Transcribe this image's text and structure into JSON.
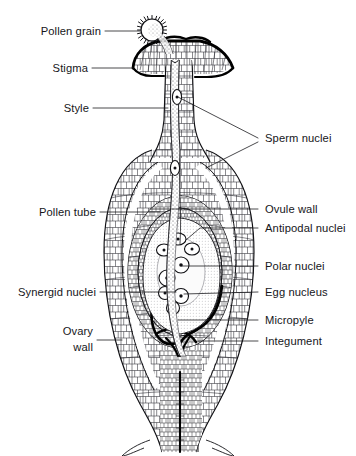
{
  "figure": {
    "width": 356,
    "height": 456,
    "background_color": "#ffffff",
    "ink_color": "#111115",
    "style": "black-and-white line drawing, stippled and cell-textured botanical illustration"
  },
  "labels_left": [
    {
      "id": "pollen-grain",
      "text": "Pollen grain",
      "x": 103,
      "y": 34,
      "leader_to_x": 140,
      "leader_to_y": 31
    },
    {
      "id": "stigma",
      "text": "Stigma",
      "x": 103,
      "y": 71,
      "leader_to_x": 133,
      "leader_to_y": 68
    },
    {
      "id": "style",
      "text": "Style",
      "x": 103,
      "y": 111,
      "leader_to_x": 168,
      "leader_to_y": 108
    },
    {
      "id": "pollen-tube",
      "text": "Pollen tube",
      "x": 103,
      "y": 215,
      "leader_to_x": 160,
      "leader_to_y": 212
    },
    {
      "id": "synergid-nuclei",
      "text": "Synergid nuclei",
      "x": 103,
      "y": 295,
      "leader_to_x": 176,
      "leader_to_y": 292
    },
    {
      "id": "ovary-wall-1",
      "text": "Ovary",
      "x": 103,
      "y": 334,
      "leader_to_x": 120,
      "leader_to_y": 340
    },
    {
      "id": "ovary-wall-2",
      "text": "wall",
      "x": 103,
      "y": 350,
      "leader_to_x": null,
      "leader_to_y": null
    }
  ],
  "labels_right": [
    {
      "id": "sperm-nuclei",
      "text": "Sperm nuclei",
      "x": 265,
      "y": 142,
      "leader_to_x": 178,
      "leader_to_y": 97
    },
    {
      "id": "ovule-wall",
      "text": "Ovule wall",
      "x": 265,
      "y": 212,
      "leader_to_x": 150,
      "leader_to_y": 212
    },
    {
      "id": "antipodal-nuclei",
      "text": "Antipodal nuclei",
      "x": 265,
      "y": 231,
      "leader_to_x": 186,
      "leader_to_y": 239
    },
    {
      "id": "polar-nuclei",
      "text": "Polar nuclei",
      "x": 265,
      "y": 269,
      "leader_to_x": 178,
      "leader_to_y": 267
    },
    {
      "id": "egg-nucleus",
      "text": "Egg nucleus",
      "x": 265,
      "y": 295,
      "leader_to_x": 180,
      "leader_to_y": 293
    },
    {
      "id": "micropyle",
      "text": "Micropyle",
      "x": 265,
      "y": 323,
      "leader_to_x": 176,
      "leader_to_y": 321
    },
    {
      "id": "integument",
      "text": "Integument",
      "x": 265,
      "y": 344,
      "leader_to_x": 196,
      "leader_to_y": 343
    }
  ],
  "sperm_nuclei_second_leader": {
    "from_x": 262,
    "from_y": 142,
    "to_x": 206,
    "to_y": 168
  },
  "structures": {
    "pollen_grain": {
      "name": "pollen grain",
      "cx": 152,
      "cy": 30,
      "r": 11,
      "spikes": 34
    },
    "stigma": {
      "name": "stigma",
      "description": "flared, dark-rimmed receptive surface at top of style"
    },
    "style": {
      "name": "style",
      "description": "elongated column connecting stigma to ovary"
    },
    "pollen_tube": {
      "name": "pollen tube",
      "description": "stippled tube running down through the style into the ovule"
    },
    "ovary_wall": {
      "name": "ovary wall",
      "description": "outer cellular oval enclosing the ovule"
    },
    "ovule_wall": {
      "name": "ovule wall",
      "description": "inner oval layer of the ovule"
    },
    "integument": {
      "name": "integument",
      "description": "heavy dark layer surrounding embryo sac, open at the micropyle"
    },
    "micropyle": {
      "name": "micropyle",
      "description": "opening in the integument where the pollen tube enters"
    },
    "embryo_sac": {
      "name": "embryo sac",
      "description": "pale central sac containing the nuclei"
    },
    "antipodal_nuclei": {
      "name": "antipodal nuclei",
      "count": 3
    },
    "polar_nuclei": {
      "name": "polar nuclei",
      "count": 2
    },
    "egg_nucleus": {
      "name": "egg nucleus",
      "count": 1
    },
    "synergid_nuclei": {
      "name": "synergid nuclei",
      "count": 2
    },
    "sperm_nuclei": {
      "name": "sperm nuclei",
      "count": 2,
      "locations": "one in upper style, one in lower style"
    }
  }
}
